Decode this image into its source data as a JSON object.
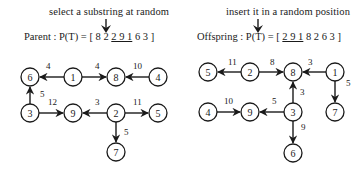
{
  "left": {
    "caption": "select a substring at random",
    "label": "Parent : P(T) = [",
    "seq_before": "8 2 ",
    "seq_selected": "2 9 1",
    "seq_after": " 6 3",
    "close": " ]",
    "nodes": [
      {
        "id": "6",
        "x": 30,
        "y": 77
      },
      {
        "id": "1",
        "x": 73,
        "y": 77
      },
      {
        "id": "8",
        "x": 116,
        "y": 77
      },
      {
        "id": "4",
        "x": 158,
        "y": 77
      },
      {
        "id": "3",
        "x": 30,
        "y": 113
      },
      {
        "id": "9",
        "x": 73,
        "y": 113
      },
      {
        "id": "2",
        "x": 116,
        "y": 113
      },
      {
        "id": "5",
        "x": 158,
        "y": 113
      },
      {
        "id": "7",
        "x": 116,
        "y": 152
      }
    ],
    "edges": [
      {
        "from": "1",
        "to": "6",
        "weight": "4",
        "lx": 46,
        "ly": 69
      },
      {
        "from": "1",
        "to": "8",
        "weight": "4",
        "lx": 95,
        "ly": 69
      },
      {
        "from": "4",
        "to": "8",
        "weight": "10",
        "lx": 133,
        "ly": 69
      },
      {
        "from": "3",
        "to": "6",
        "weight": "5",
        "lx": 40,
        "ly": 97
      },
      {
        "from": "3",
        "to": "9",
        "weight": "12",
        "lx": 48,
        "ly": 105
      },
      {
        "from": "2",
        "to": "9",
        "weight": "3",
        "lx": 95,
        "ly": 105
      },
      {
        "from": "2",
        "to": "5",
        "weight": "11",
        "lx": 133,
        "ly": 105
      },
      {
        "from": "2",
        "to": "7",
        "weight": "5",
        "lx": 124,
        "ly": 135
      }
    ]
  },
  "right": {
    "caption": "insert it in a random position",
    "label": "Offspring : P(T) = [",
    "seq_inserted": "2 9 1",
    "seq_after": " 8 2 6 3",
    "close": "  ]",
    "nodes": [
      {
        "id": "5",
        "x": 208,
        "y": 72
      },
      {
        "id": "2",
        "x": 250,
        "y": 72
      },
      {
        "id": "8",
        "x": 293,
        "y": 72
      },
      {
        "id": "1",
        "x": 335,
        "y": 72
      },
      {
        "id": "4",
        "x": 208,
        "y": 112
      },
      {
        "id": "9",
        "x": 250,
        "y": 112
      },
      {
        "id": "3",
        "x": 293,
        "y": 112
      },
      {
        "id": "7",
        "x": 335,
        "y": 112
      },
      {
        "id": "6",
        "x": 293,
        "y": 153
      }
    ],
    "edges": [
      {
        "from": "2",
        "to": "5",
        "weight": "11",
        "lx": 228,
        "ly": 65
      },
      {
        "from": "2",
        "to": "8",
        "weight": "8",
        "lx": 270,
        "ly": 65
      },
      {
        "from": "1",
        "to": "8",
        "weight": "3",
        "lx": 308,
        "ly": 65
      },
      {
        "from": "1",
        "to": "7",
        "weight": "5",
        "lx": 346,
        "ly": 86
      },
      {
        "from": "3",
        "to": "8",
        "weight": "3",
        "lx": 300,
        "ly": 95
      },
      {
        "from": "4",
        "to": "9",
        "weight": "10",
        "lx": 224,
        "ly": 104
      },
      {
        "from": "3",
        "to": "9",
        "weight": "5",
        "lx": 272,
        "ly": 104
      },
      {
        "from": "3",
        "to": "6",
        "weight": "9",
        "lx": 301,
        "ly": 130
      }
    ]
  }
}
